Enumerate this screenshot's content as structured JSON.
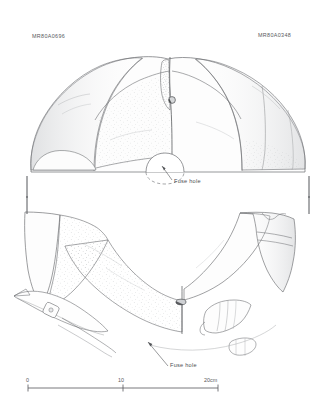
{
  "figure": {
    "type": "archaeological-line-drawing",
    "background_color": "#ffffff",
    "ink_color": "#6e7073",
    "shade_color": "#b9bbbe"
  },
  "catalogue": {
    "left_label": "MR80A0696",
    "right_label": "MR80A0348"
  },
  "annotations": {
    "fuse_hole_upper": "Fuse hole",
    "fuse_hole_lower": "Fuse hole"
  },
  "scale_bar": {
    "start_label": "0",
    "mid_label": "10",
    "end_label": "20cm",
    "unit": "cm",
    "min": 0,
    "max": 20
  },
  "views": {
    "upper": "elevation view of reassembled bell fragments",
    "lower": "profile and section view of bell with rim detail"
  }
}
